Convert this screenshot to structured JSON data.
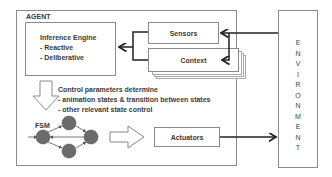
{
  "agent": {
    "label": "AGENT"
  },
  "inference_engine": {
    "title": "Inference Engine",
    "items": [
      "- Reactive",
      "- Deliberative"
    ]
  },
  "sensors": {
    "label": "Sensors"
  },
  "context": {
    "label": "Context"
  },
  "control_text": {
    "title": "Control parameters determine",
    "lines": [
      "- animation states & transition between states",
      "- other relevant state control"
    ]
  },
  "fsm": {
    "label": "FSM"
  },
  "actuators": {
    "label": "Actuators"
  },
  "environment": {
    "label": "ENVIRONMENT",
    "letters": [
      "E",
      "N",
      "V",
      "I",
      "R",
      "O",
      "N",
      "M",
      "E",
      "N",
      "T"
    ]
  },
  "colors": {
    "border": "#8a8a8a",
    "node_fill": "#6b6b6b",
    "arrow": "#222222"
  }
}
